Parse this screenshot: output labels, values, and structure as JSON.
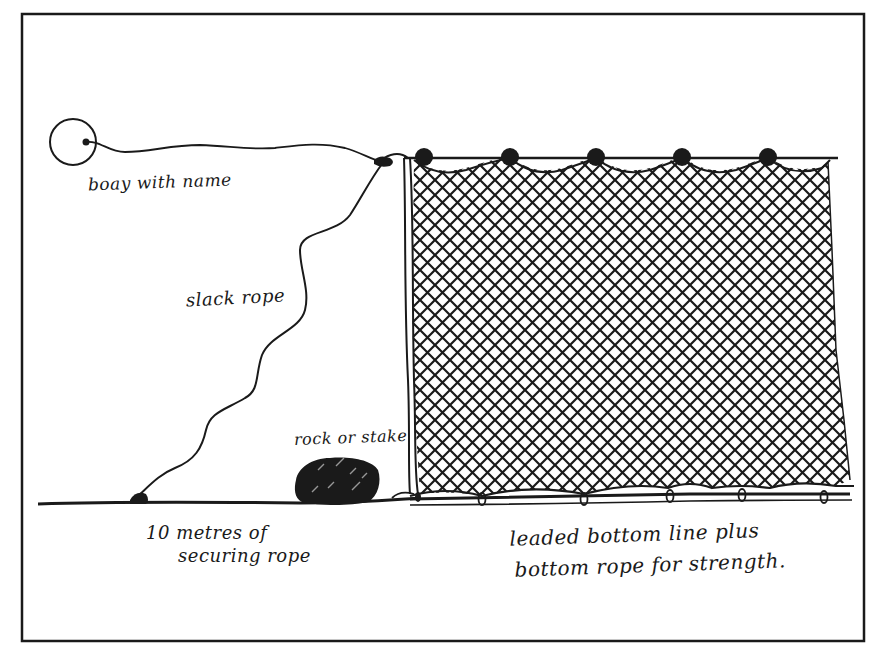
{
  "diagram": {
    "colors": {
      "ink": "#1a1a1a",
      "background": "#ffffff"
    },
    "labels": {
      "buoy": "boay with name",
      "slack_rope": "slack rope",
      "rock_or_stake": "rock or stake",
      "securing_rope_line1": "10 metres of",
      "securing_rope_line2": "securing rope",
      "bottom_line_line1": "leaded bottom line plus",
      "bottom_line_line2": "bottom rope for strength."
    },
    "elements": {
      "float_count": 5,
      "bottom_lead_count": 6,
      "components": [
        "buoy",
        "float-line",
        "slack-rope",
        "net-mesh",
        "floats",
        "rock-anchor",
        "securing-rope",
        "leaded-bottom-line",
        "bottom-rope"
      ]
    }
  }
}
